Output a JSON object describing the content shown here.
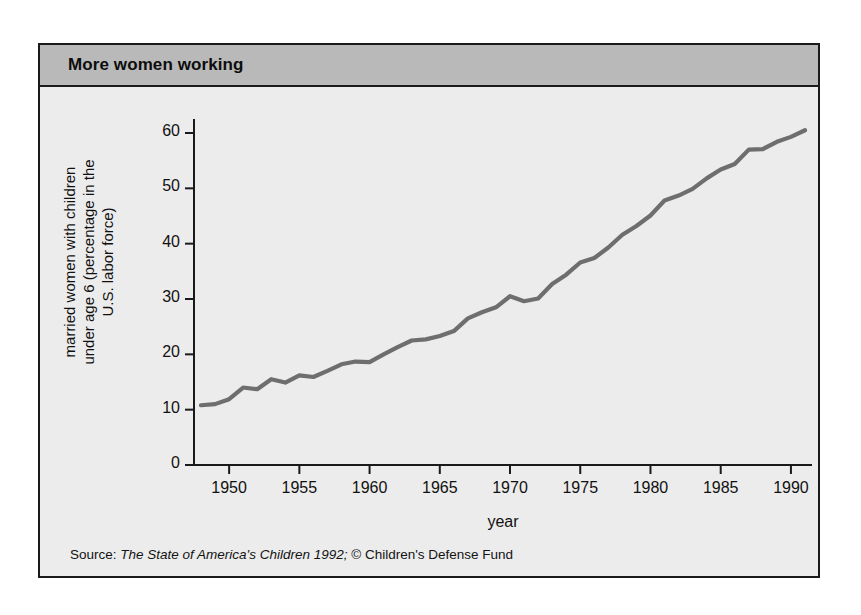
{
  "figure": {
    "title": "More women working",
    "source": {
      "prefix": "Source:",
      "work_title": "The State of America's Children 1992;",
      "credit": "© Children's Defense Fund"
    },
    "colors": {
      "band": "#b9b9b9",
      "panel": "#ececec",
      "frame": "#1a1a1a",
      "line": "#6e6e6e",
      "axis": "#1a1a1a"
    }
  },
  "chart_data": {
    "type": "line",
    "title": "More women working",
    "xlabel": "year",
    "ylabel": "married women with children under age 6 (percentage in the U.S. labor force)",
    "ylabel_lines": [
      "married women with children",
      "under age 6 (percentage in the"
    ],
    "ylabel_line3": "U.S. labor force)",
    "xlim": [
      1947.5,
      1991.5
    ],
    "ylim": [
      0,
      62
    ],
    "xticks": [
      1950,
      1955,
      1960,
      1965,
      1970,
      1975,
      1980,
      1985,
      1990
    ],
    "yticks": [
      0,
      10,
      20,
      30,
      40,
      50,
      60
    ],
    "grid": false,
    "legend": null,
    "series": [
      {
        "name": "married women with children under age 6 in U.S. labor force",
        "color": "#6e6e6e",
        "x": [
          1948,
          1949,
          1950,
          1951,
          1952,
          1953,
          1954,
          1955,
          1956,
          1957,
          1958,
          1959,
          1960,
          1961,
          1962,
          1963,
          1964,
          1965,
          1966,
          1967,
          1968,
          1969,
          1970,
          1971,
          1972,
          1973,
          1974,
          1975,
          1976,
          1977,
          1978,
          1979,
          1980,
          1981,
          1982,
          1983,
          1984,
          1985,
          1986,
          1987,
          1988,
          1989,
          1990,
          1991
        ],
        "values": [
          10.8,
          11.0,
          11.9,
          14.0,
          13.7,
          15.5,
          14.9,
          16.2,
          15.9,
          17.0,
          18.2,
          18.7,
          18.6,
          20.0,
          21.3,
          22.5,
          22.7,
          23.3,
          24.2,
          26.5,
          27.6,
          28.5,
          30.5,
          29.6,
          30.1,
          32.7,
          34.4,
          36.6,
          37.4,
          39.3,
          41.6,
          43.2,
          45.1,
          47.8,
          48.7,
          49.9,
          51.8,
          53.4,
          54.4,
          57.0,
          57.1,
          58.4,
          59.3,
          60.5
        ]
      }
    ]
  }
}
